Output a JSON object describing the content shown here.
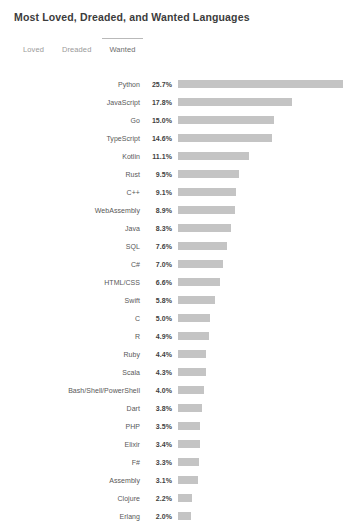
{
  "header": {
    "title": "Most Loved, Dreaded, and Wanted Languages"
  },
  "tabs": {
    "items": [
      {
        "label": "Loved",
        "active": false
      },
      {
        "label": "Dreaded",
        "active": false
      },
      {
        "label": "Wanted",
        "active": true
      }
    ],
    "active_label": "Wanted"
  },
  "colors": {
    "background": "#ffffff",
    "bar": "#c4c4c4",
    "title_text": "#3c3c3c",
    "label_text": "#585858",
    "value_text": "#3f3f3f",
    "tab_text": "#9a9a9a",
    "tab_active_text": "#6e6e6e",
    "tab_indicator": "#b9b9b9"
  },
  "chart_data": {
    "type": "bar",
    "orientation": "horizontal",
    "title": "Most Loved, Dreaded, and Wanted Languages",
    "subtitle": "Wanted",
    "xlabel": "",
    "ylabel": "",
    "xlim": [
      0,
      25.7
    ],
    "grid": false,
    "legend": false,
    "value_suffix": "%",
    "categories": [
      "Python",
      "JavaScript",
      "Go",
      "TypeScript",
      "Kotlin",
      "Rust",
      "C++",
      "WebAssembly",
      "Java",
      "SQL",
      "C#",
      "HTML/CSS",
      "Swift",
      "C",
      "R",
      "Ruby",
      "Scala",
      "Bash/Shell/PowerShell",
      "Dart",
      "PHP",
      "Elixir",
      "F#",
      "Assembly",
      "Clojure",
      "Erlang"
    ],
    "values": [
      25.7,
      17.8,
      15.0,
      14.6,
      11.1,
      9.5,
      9.1,
      8.9,
      8.3,
      7.6,
      7.0,
      6.6,
      5.8,
      5.0,
      4.9,
      4.4,
      4.3,
      4.0,
      3.8,
      3.5,
      3.4,
      3.3,
      3.1,
      2.2,
      2.0
    ],
    "value_labels": [
      "25.7%",
      "17.8%",
      "15.0%",
      "14.6%",
      "11.1%",
      "9.5%",
      "9.1%",
      "8.9%",
      "8.3%",
      "7.6%",
      "7.0%",
      "6.6%",
      "5.8%",
      "5.0%",
      "4.9%",
      "4.4%",
      "4.3%",
      "4.0%",
      "3.8%",
      "3.5%",
      "3.4%",
      "3.3%",
      "3.1%",
      "2.2%",
      "2.0%"
    ]
  }
}
